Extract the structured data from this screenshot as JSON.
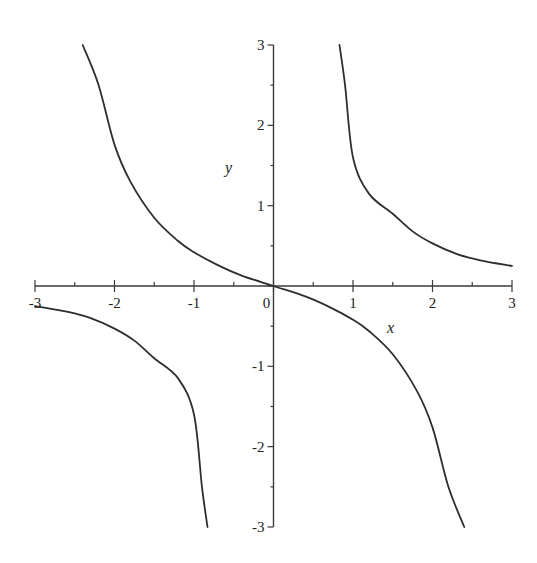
{
  "chart_data": {
    "type": "line",
    "title": "",
    "xlabel": "x",
    "ylabel": "y",
    "xlim": [
      -3,
      3
    ],
    "ylim": [
      -3,
      3
    ],
    "grid": false,
    "legend": null,
    "x_ticks": [
      -3,
      -2,
      -1,
      0,
      1,
      2,
      3
    ],
    "y_ticks": [
      -3,
      -2,
      -1,
      1,
      2,
      3
    ],
    "x_tick_labels": [
      "-3",
      "-2",
      "-1",
      "0",
      "1",
      "2",
      "3"
    ],
    "y_tick_labels": [
      "-3",
      "-2",
      "-1",
      "1",
      "2",
      "3"
    ],
    "series": [
      {
        "name": "middle-branch",
        "points": [
          [
            -2.4,
            3.0
          ],
          [
            -2.2,
            2.5
          ],
          [
            -2.0,
            1.76
          ],
          [
            -1.8,
            1.3
          ],
          [
            -1.5,
            0.85
          ],
          [
            -1.2,
            0.56
          ],
          [
            -1.0,
            0.42
          ],
          [
            -0.7,
            0.26
          ],
          [
            -0.4,
            0.13
          ],
          [
            0.0,
            0.0
          ],
          [
            0.4,
            -0.13
          ],
          [
            0.7,
            -0.26
          ],
          [
            1.0,
            -0.42
          ],
          [
            1.2,
            -0.56
          ],
          [
            1.5,
            -0.85
          ],
          [
            1.8,
            -1.3
          ],
          [
            2.0,
            -1.76
          ],
          [
            2.2,
            -2.5
          ],
          [
            2.4,
            -3.0
          ]
        ]
      },
      {
        "name": "upper-right-branch",
        "points": [
          [
            0.83,
            3.0
          ],
          [
            0.9,
            2.5
          ],
          [
            1.0,
            1.6
          ],
          [
            1.2,
            1.15
          ],
          [
            1.5,
            0.9
          ],
          [
            1.75,
            0.68
          ],
          [
            2.0,
            0.53
          ],
          [
            2.3,
            0.4
          ],
          [
            2.6,
            0.32
          ],
          [
            3.0,
            0.25
          ]
        ]
      },
      {
        "name": "lower-left-branch",
        "points": [
          [
            -3.0,
            -0.25
          ],
          [
            -2.6,
            -0.32
          ],
          [
            -2.3,
            -0.4
          ],
          [
            -2.0,
            -0.53
          ],
          [
            -1.75,
            -0.68
          ],
          [
            -1.5,
            -0.9
          ],
          [
            -1.2,
            -1.15
          ],
          [
            -1.0,
            -1.6
          ],
          [
            -0.9,
            -2.5
          ],
          [
            -0.83,
            -3.0
          ]
        ]
      }
    ]
  },
  "colors": {
    "background": "#ffffff",
    "axis": "#3a3a3a",
    "curve": "#2e2e2e",
    "text": "#222222"
  }
}
